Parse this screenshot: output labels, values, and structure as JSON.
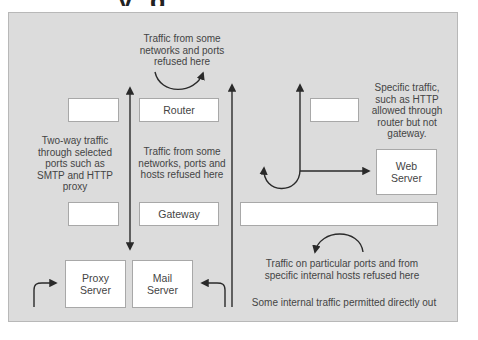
{
  "diagram": {
    "title_fragment": "y g",
    "colors": {
      "background": "#dcdcdc",
      "box_fill": "#ffffff",
      "box_border": "#a8a8a8",
      "line": "#2a2a2a",
      "text": "#444444"
    },
    "nodes": {
      "router": "Router",
      "gateway": "Gateway",
      "web_server": "Web\nServer",
      "proxy_server": "Proxy\nServer",
      "mail_server": "Mail\nServer",
      "blank_top_left": "",
      "blank_top_right": "",
      "blank_mid_left": "",
      "blank_mid_wide": ""
    },
    "annotations": {
      "router_refusal": "Traffic from some networks and ports refused here",
      "two_way": "Two-way traffic through selected ports such as SMTP and HTTP proxy",
      "gateway_refusal": "Traffic from some networks, ports and hosts refused here",
      "specific_traffic": "Specific traffic, such as HTTP allowed through router but not gateway.",
      "particular_ports": "Traffic on particular ports and from specific internal hosts refused here",
      "internal_out": "Some internal traffic permitted directly out"
    }
  }
}
